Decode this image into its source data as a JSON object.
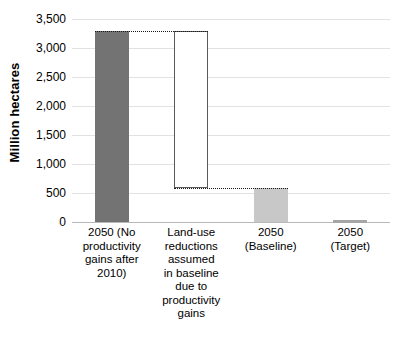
{
  "chart_data": {
    "type": "bar",
    "title": "",
    "subtitle": "",
    "xlabel": "",
    "ylabel": "Million hectares",
    "ylim": [
      0,
      3500
    ],
    "y_ticks": [
      0,
      500,
      1000,
      1500,
      2000,
      2500,
      3000,
      3500
    ],
    "y_tick_labels": [
      "0",
      "500",
      "1,000",
      "1,500",
      "2,000",
      "2,500",
      "3,000",
      "3,500"
    ],
    "grid": true,
    "legend": "none",
    "categories": [
      "2050 (No productivity gains after 2010)",
      "Land-use reductions assumed in baseline due to productivity gains",
      "2050 (Baseline)",
      "2050 (Target)"
    ],
    "values": [
      3290,
      2704,
      586,
      35
    ],
    "bars": [
      {
        "label": "2050 (No productivity gains after 2010)",
        "label_lines": "2050 (No\nproductivity\ngains after\n2010)",
        "base": 0,
        "top": 3290,
        "value": 3290,
        "style": "solid-dark",
        "color": "#737373"
      },
      {
        "label": "Land-use reductions assumed in baseline due to productivity gains",
        "label_lines": "Land-use\nreductions\nassumed\nin baseline\ndue to\nproductivity\ngains",
        "base": 586,
        "top": 3290,
        "value": 2704,
        "style": "hollow",
        "color": "#ffffff"
      },
      {
        "label": "2050 (Baseline)",
        "label_lines": "2050\n(Baseline)",
        "base": 0,
        "top": 586,
        "value": 586,
        "style": "solid-light",
        "color": "#c8c8c8"
      },
      {
        "label": "2050 (Target)",
        "label_lines": "2050\n(Target)",
        "base": 0,
        "top": 35,
        "value": 35,
        "style": "solid-mid",
        "color": "#a6a6a6"
      }
    ],
    "connectors": [
      {
        "name": "top-connector",
        "y_value": 3290,
        "from_bar": 0,
        "to_bar": 1
      },
      {
        "name": "bottom-connector",
        "y_value": 586,
        "from_bar": 1,
        "to_bar": 2
      }
    ],
    "colors": {
      "bar_dark": "#737373",
      "bar_light": "#c8c8c8",
      "bar_mid": "#a6a6a6",
      "hollow_outline": "#5a5a5a",
      "gridline": "#e2e2e2",
      "axis_line": "#b9b9b9",
      "text": "#000000",
      "background": "#ffffff"
    }
  }
}
